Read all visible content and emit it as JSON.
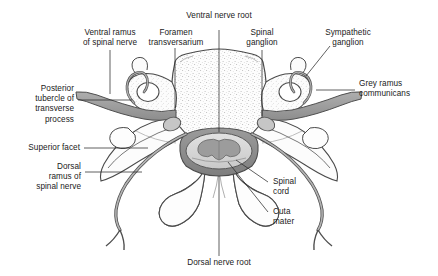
{
  "figure": {
    "background_color": "#ffffff",
    "line_color": "#3a3a3a",
    "label_color": "#1a1a1a",
    "nerve_fill": "#9a9a9a",
    "dura_fill": "#8e8e8e",
    "cord_fill": "#d8d8d8",
    "grey_matter_fill": "#9c9c9c",
    "bone_fill": "#fdfdfd",
    "stipple_color": "#b9b9b9"
  },
  "labels": {
    "ventral_ramus": "Ventral ramus\nof spinal nerve",
    "foramen_transversarium": "Foramen\ntransversarium",
    "ventral_nerve_root": "Ventral nerve root",
    "spinal_ganglion": "Spinal\nganglion",
    "sympathetic_ganglion": "Sympathetic\nganglion",
    "grey_ramus_communicans": "Grey ramus\ncommunicans",
    "posterior_tubercle": "Posterior\ntubercle of\ntransverse\nprocess",
    "superior_facet": "Superior facet",
    "dorsal_ramus": "Dorsal\nramus of\nspinal nerve",
    "spinal_cord": "Spinal\ncord",
    "cuta_mater": "Cuta\nmater",
    "dorsal_nerve_root": "Dorsal nerve root"
  }
}
